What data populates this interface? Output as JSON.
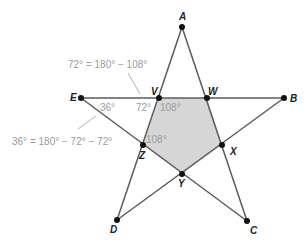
{
  "colors": {
    "line": "#5a5a5a",
    "fill": "#d6d6d6",
    "point": "#111111",
    "annotation": "#9a9a9a",
    "label": "#222222"
  },
  "points": {
    "A": {
      "x": 182,
      "y": 27,
      "label": "A",
      "lx": 179,
      "ly": 20
    },
    "B": {
      "x": 284,
      "y": 98,
      "label": "B",
      "lx": 290,
      "ly": 102
    },
    "C": {
      "x": 247,
      "y": 221,
      "label": "C",
      "lx": 250,
      "ly": 234
    },
    "D": {
      "x": 117,
      "y": 220,
      "label": "D",
      "lx": 110,
      "ly": 233
    },
    "E": {
      "x": 81,
      "y": 98,
      "label": "E",
      "lx": 70,
      "ly": 101
    },
    "V": {
      "x": 159,
      "y": 98,
      "label": "V",
      "lx": 151,
      "ly": 95
    },
    "W": {
      "x": 207,
      "y": 98,
      "label": "W",
      "lx": 208,
      "ly": 95
    },
    "X": {
      "x": 222,
      "y": 145,
      "label": "X",
      "lx": 230,
      "ly": 155
    },
    "Y": {
      "x": 182,
      "y": 174,
      "label": "Y",
      "lx": 178,
      "ly": 187
    },
    "Z": {
      "x": 143,
      "y": 145,
      "label": "Z",
      "lx": 139,
      "ly": 159
    }
  },
  "angles": [
    {
      "text": "36°",
      "x": 100,
      "y": 111
    },
    {
      "text": "72°",
      "x": 136,
      "y": 111
    },
    {
      "text": "108°",
      "x": 160,
      "y": 111
    },
    {
      "text": "108°",
      "x": 146,
      "y": 143
    }
  ],
  "annotations": [
    {
      "text": "72° = 180° − 108°",
      "x": 68,
      "y": 68,
      "leader": {
        "x1": 128,
        "y1": 73,
        "x2": 140,
        "y2": 94
      }
    },
    {
      "text": "36° = 180° − 72° − 72°",
      "x": 12,
      "y": 145,
      "leader": {
        "x1": 78,
        "y1": 129,
        "x2": 96,
        "y2": 116
      }
    }
  ]
}
